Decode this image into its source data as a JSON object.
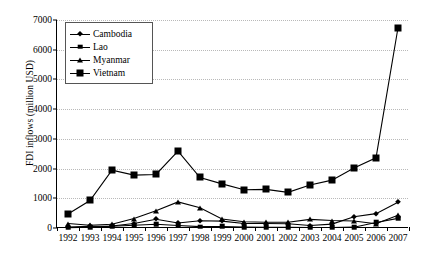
{
  "chart_data": {
    "type": "line",
    "title": "",
    "xlabel": "",
    "ylabel": "FDI inflows (million USD)",
    "categories": [
      "1992",
      "1993",
      "1994",
      "1995",
      "1996",
      "1997",
      "1998",
      "1999",
      "2000",
      "2001",
      "2002",
      "2003",
      "2004",
      "2005",
      "2006",
      "2007"
    ],
    "x": [
      1992,
      1993,
      1994,
      1995,
      1996,
      1997,
      1998,
      1999,
      2000,
      2001,
      2002,
      2003,
      2004,
      2005,
      2006,
      2007
    ],
    "ylim": [
      0,
      7000
    ],
    "yticks": [
      0,
      1000,
      2000,
      3000,
      4000,
      5000,
      6000,
      7000
    ],
    "ytick_labels": [
      "0",
      "1000",
      "2000",
      "3000",
      "4000",
      "5000",
      "6000",
      "7000"
    ],
    "grid": true,
    "legend_position": "upper-left-inside",
    "series": [
      {
        "name": "Cambodia",
        "marker": "diamond",
        "color": "#000000",
        "values": [
          33,
          54,
          69,
          151,
          294,
          168,
          243,
          232,
          149,
          149,
          145,
          84,
          131,
          381,
          483,
          867
        ]
      },
      {
        "name": "Lao",
        "marker": "square",
        "color": "#000000",
        "values": [
          8,
          30,
          59,
          95,
          128,
          86,
          45,
          52,
          34,
          24,
          25,
          19,
          17,
          28,
          187,
          324
        ]
      },
      {
        "name": "Myanmar",
        "marker": "triangle",
        "color": "#000000",
        "values": [
          149,
          91,
          126,
          318,
          581,
          879,
          684,
          304,
          208,
          192,
          191,
          291,
          251,
          236,
          143,
          428
        ]
      },
      {
        "name": "Vietnam",
        "marker": "filled-square",
        "color": "#000000",
        "values": [
          474,
          926,
          1945,
          1780,
          1803,
          2587,
          1700,
          1484,
          1289,
          1300,
          1200,
          1450,
          1610,
          2021,
          2360,
          6739
        ]
      }
    ]
  },
  "legend": {
    "items": [
      {
        "label": "Cambodia"
      },
      {
        "label": "Lao"
      },
      {
        "label": "Myanmar"
      },
      {
        "label": "Vietnam"
      }
    ]
  }
}
